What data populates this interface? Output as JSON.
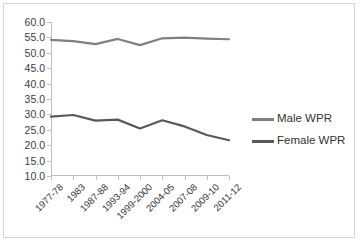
{
  "chart_data": {
    "type": "line",
    "title": "",
    "xlabel": "",
    "ylabel": "",
    "categories": [
      "1977-78",
      "1983",
      "1987-88",
      "1993-94",
      "1999-2000",
      "2004-05",
      "2007-08",
      "2009-10",
      "2011-12"
    ],
    "series": [
      {
        "name": "Male WPR",
        "color": "#808080",
        "values": [
          54.2,
          53.8,
          52.8,
          54.5,
          52.5,
          54.7,
          54.9,
          54.6,
          54.4
        ]
      },
      {
        "name": "Female WPR",
        "color": "#595959",
        "values": [
          29.3,
          29.8,
          28.0,
          28.3,
          25.4,
          28.1,
          26.1,
          23.3,
          21.6
        ]
      }
    ],
    "ylim": [
      10.0,
      60.0
    ],
    "ytick_step": 5.0,
    "ytick_labels": [
      "60.0",
      "55.0",
      "50.0",
      "45.0",
      "40.0",
      "35.0",
      "30.0",
      "25.0",
      "20.0",
      "15.0",
      "10.0"
    ],
    "grid": false,
    "legend_position": "right",
    "axis_color": "#bfbfbf",
    "frame_color": "#d4d4d4"
  },
  "legend": {
    "entries": [
      {
        "label": "Male WPR"
      },
      {
        "label": "Female WPR"
      }
    ]
  }
}
